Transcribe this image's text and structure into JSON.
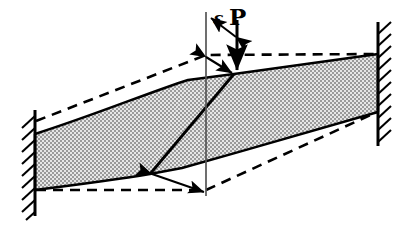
{
  "figure": {
    "canvas": {
      "width": 397,
      "height": 229,
      "background": "#ffffff"
    },
    "colors": {
      "line": "#000000",
      "fill_stipple": "#b9b9b9",
      "fill_base": "#e2e2e2",
      "background": "#ffffff"
    }
  },
  "labels": {
    "eccentricity": "ε",
    "load": "P"
  },
  "supports": {
    "left_wall": {
      "name": "left-fixed-support",
      "x": 35,
      "y_top": 110,
      "y_bottom": 216,
      "hatch_side": "left"
    },
    "right_wall": {
      "name": "right-fixed-support",
      "x": 378,
      "y_top": 22,
      "y_bottom": 146,
      "hatch_side": "right"
    }
  },
  "geometry": {
    "deformed_outline": [
      [
        35,
        134
      ],
      [
        188,
        80
      ],
      [
        234,
        74
      ],
      [
        378,
        54
      ],
      [
        378,
        112
      ],
      [
        182,
        168
      ],
      [
        150,
        174
      ],
      [
        35,
        190
      ]
    ],
    "shear_band": [
      [
        234,
        74
      ],
      [
        150,
        174
      ]
    ],
    "undeformed_top_dashed": [
      [
        35,
        120
      ],
      [
        206,
        55
      ],
      [
        378,
        54
      ]
    ],
    "undeformed_bottom_dashed": [
      [
        35,
        190
      ],
      [
        206,
        190
      ],
      [
        378,
        112
      ]
    ],
    "reference_vertical": {
      "x": 206,
      "y_top": 12,
      "y_bottom": 196
    },
    "load_arrow": {
      "x": 237,
      "y_top": 20,
      "y_bottom": 72
    },
    "eccentricity_arrow": {
      "from": [
        236,
        36
      ],
      "to": [
        210,
        18
      ]
    },
    "top_offset_arrow": {
      "from": [
        206,
        57
      ],
      "to": [
        234,
        74
      ]
    },
    "bottom_offset_arrow": {
      "from": [
        152,
        174
      ],
      "to": [
        205,
        193
      ]
    }
  },
  "annotations": [
    {
      "name": "eccentricity-label",
      "text": "ε",
      "meaning": "load eccentricity from reference axis"
    },
    {
      "name": "load-label",
      "text": "P",
      "meaning": "applied concentrated load"
    }
  ]
}
